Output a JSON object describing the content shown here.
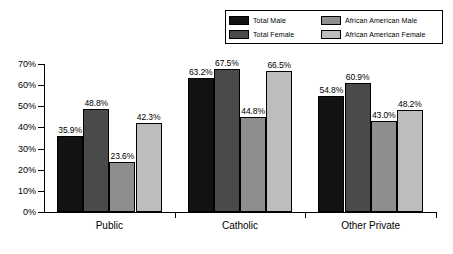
{
  "chart_data": {
    "type": "bar",
    "title": "",
    "subtitle": "",
    "xlabel": "",
    "ylabel": "",
    "ylim": [
      0,
      70
    ],
    "ytick_step": 10,
    "ytick_labels": [
      "0%",
      "10%",
      "20%",
      "30%",
      "40%",
      "50%",
      "60%",
      "70%"
    ],
    "grid": false,
    "legend_position": "top-right",
    "value_labels": true,
    "value_label_suffix": "%",
    "categories": [
      "Public",
      "Catholic",
      "Other Private"
    ],
    "series": [
      {
        "name": "Total Male",
        "color": "#121212",
        "values": [
          35.9,
          63.2,
          54.8
        ],
        "labels": [
          "35.9%",
          "63.2%",
          "54.8%"
        ]
      },
      {
        "name": "Total Female",
        "color": "#4a4a4a",
        "values": [
          48.8,
          67.5,
          60.9
        ],
        "labels": [
          "48.8%",
          "67.5%",
          "60.9%"
        ]
      },
      {
        "name": "African American Male",
        "color": "#8e8e8e",
        "values": [
          23.6,
          44.8,
          43.0
        ],
        "labels": [
          "23.6%",
          "44.8%",
          "43.0%"
        ]
      },
      {
        "name": "African American Female",
        "color": "#bdbdbd",
        "values": [
          42.3,
          66.5,
          48.2
        ],
        "labels": [
          "42.3%",
          "66.5%",
          "48.2%"
        ]
      }
    ]
  },
  "legend": {
    "items": [
      {
        "label": "Total Male",
        "color": "#121212"
      },
      {
        "label": "Total Female",
        "color": "#4a4a4a"
      },
      {
        "label": "African American Male",
        "color": "#8e8e8e"
      },
      {
        "label": "African American Female",
        "color": "#bdbdbd"
      }
    ]
  }
}
